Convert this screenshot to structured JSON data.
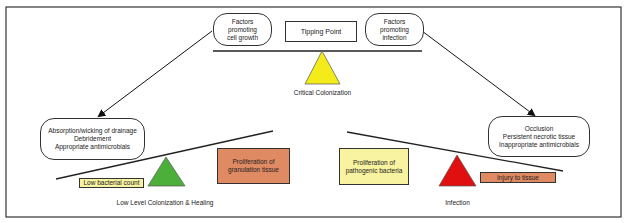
{
  "diagram": {
    "top": {
      "left_factor": "Factors promoting cell growth",
      "left_factor_lines": [
        "Factors",
        "promoting",
        "cell growth"
      ],
      "center_box": "Tipping Point",
      "right_factor_lines": [
        "Factors",
        "promoting",
        "infection"
      ],
      "fulcrum_label": "Critical Colonization",
      "fulcrum_color": "#f3ec1a"
    },
    "left": {
      "interventions": [
        "Absorption/wicking of drainage",
        "Debridement",
        "Appropriate antimicrobials"
      ],
      "low_box": "Low bacterial count",
      "low_box_color": "#f8f3a0",
      "high_box_lines": [
        "Proliferation of",
        "granulation tissue"
      ],
      "high_box_color": "#e08a63",
      "fulcrum_color": "#4caf3a",
      "caption": "Low Level Colonization & Healing"
    },
    "right": {
      "factors": [
        "Occlusion",
        "Persistent necrotic tissue",
        "Inappropriate antimicrobials"
      ],
      "high_box_lines": [
        "Proliferation of",
        "pathogenic bacteria"
      ],
      "high_box_color": "#f8f3a0",
      "low_box": "Injury to tissue",
      "low_box_color": "#e08a63",
      "fulcrum_color": "#e01010",
      "caption": "Infection"
    }
  }
}
